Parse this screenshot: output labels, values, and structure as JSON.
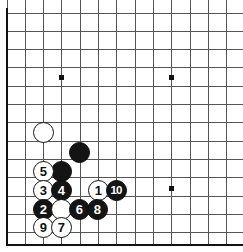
{
  "figure": {
    "board_style": {
      "line_color": "#555555",
      "border_color": "#111111",
      "background_color": "#ffffff",
      "black_stone_color": "#141414",
      "white_stone_color": "#ffffff",
      "star_point_color": "#111111"
    },
    "geometry": {
      "origin_x": 7,
      "origin_y": 13,
      "spacing": 18.3,
      "columns": 14,
      "rows": 14,
      "stone_radius": 10.5,
      "border_left_x": 7,
      "border_bottom_y": 245
    },
    "star_points": [
      {
        "name": "star-point-upper-left",
        "x": 61,
        "y": 77
      },
      {
        "name": "star-point-upper-right",
        "x": 171,
        "y": 77
      },
      {
        "name": "star-point-lower-right",
        "x": 171,
        "y": 188
      }
    ],
    "stones": [
      {
        "id": "stone-white-blank-upper",
        "color": "white",
        "label": "",
        "x": 43,
        "y": 132
      },
      {
        "id": "stone-black-blank-upper",
        "color": "black",
        "label": "",
        "x": 79,
        "y": 152
      },
      {
        "id": "stone-black-blank-mid",
        "color": "black",
        "label": "",
        "x": 61,
        "y": 171
      },
      {
        "id": "stone-white-5",
        "color": "white",
        "label": "5",
        "x": 43,
        "y": 171
      },
      {
        "id": "stone-white-3",
        "color": "white",
        "label": "3",
        "x": 43,
        "y": 190
      },
      {
        "id": "stone-black-4",
        "color": "black",
        "label": "4",
        "x": 61,
        "y": 190
      },
      {
        "id": "stone-white-1",
        "color": "white",
        "label": "1",
        "x": 98,
        "y": 190
      },
      {
        "id": "stone-black-10",
        "color": "black",
        "label": "10",
        "x": 116,
        "y": 190
      },
      {
        "id": "stone-black-2",
        "color": "black",
        "label": "2",
        "x": 43,
        "y": 209
      },
      {
        "id": "stone-white-blank-lower",
        "color": "white",
        "label": "",
        "x": 61,
        "y": 209
      },
      {
        "id": "stone-black-6",
        "color": "black",
        "label": "6",
        "x": 79,
        "y": 209
      },
      {
        "id": "stone-black-8",
        "color": "black",
        "label": "8",
        "x": 97,
        "y": 209
      },
      {
        "id": "stone-white-9",
        "color": "white",
        "label": "9",
        "x": 43,
        "y": 227
      },
      {
        "id": "stone-white-7",
        "color": "white",
        "label": "7",
        "x": 61,
        "y": 227
      }
    ]
  }
}
